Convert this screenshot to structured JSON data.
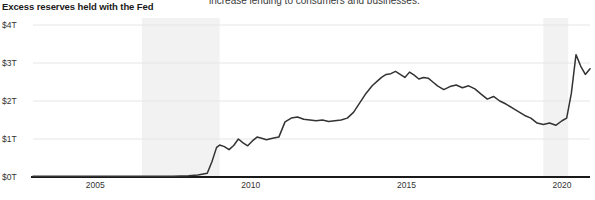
{
  "chart_data": {
    "type": "line",
    "title": "Excess reserves held with the Fed",
    "xlabel": "",
    "ylabel": "",
    "ylim": [
      0,
      4
    ],
    "xlim": [
      2003.0,
      2020.9
    ],
    "y_unit": "trillions of USD",
    "grid": true,
    "legend": "none",
    "y_ticks": [
      0,
      1,
      2,
      3,
      4
    ],
    "y_tick_labels": [
      "$0T",
      "$1T",
      "$2T",
      "$3T",
      "$4T"
    ],
    "x_ticks": [
      2005,
      2010,
      2015,
      2020
    ],
    "x_tick_labels": [
      "2005",
      "2010",
      "2015",
      "2020"
    ],
    "line_color": "#333333",
    "grid_color": "#e6e6e6",
    "axis_color": "#1a1a1a",
    "shaded_regions": [
      {
        "label": "recession",
        "x0": 2006.5,
        "x1": 2009.0,
        "color": "#f2f2f2"
      },
      {
        "label": "recession",
        "x0": 2019.4,
        "x1": 2020.2,
        "color": "#f2f2f2"
      }
    ],
    "series": [
      {
        "name": "Excess reserves held with the Fed",
        "x": [
          2003.0,
          2003.5,
          2004.0,
          2004.5,
          2005.0,
          2005.5,
          2006.0,
          2006.5,
          2007.0,
          2007.5,
          2008.0,
          2008.3,
          2008.6,
          2008.75,
          2008.9,
          2009.0,
          2009.15,
          2009.3,
          2009.45,
          2009.6,
          2009.75,
          2009.9,
          2010.05,
          2010.2,
          2010.35,
          2010.5,
          2010.7,
          2010.9,
          2011.1,
          2011.3,
          2011.5,
          2011.7,
          2011.9,
          2012.1,
          2012.3,
          2012.5,
          2012.7,
          2012.9,
          2013.1,
          2013.3,
          2013.5,
          2013.7,
          2013.9,
          2014.1,
          2014.2,
          2014.35,
          2014.5,
          2014.65,
          2014.8,
          2014.95,
          2015.1,
          2015.25,
          2015.4,
          2015.55,
          2015.7,
          2015.85,
          2016.0,
          2016.2,
          2016.4,
          2016.6,
          2016.8,
          2017.0,
          2017.2,
          2017.4,
          2017.6,
          2017.8,
          2018.0,
          2018.2,
          2018.4,
          2018.6,
          2018.8,
          2019.0,
          2019.2,
          2019.4,
          2019.6,
          2019.8,
          2020.0,
          2020.15,
          2020.3,
          2020.45,
          2020.6,
          2020.75,
          2020.9
        ],
        "y": [
          0.02,
          0.02,
          0.02,
          0.02,
          0.02,
          0.02,
          0.02,
          0.02,
          0.02,
          0.02,
          0.03,
          0.05,
          0.1,
          0.4,
          0.78,
          0.84,
          0.8,
          0.72,
          0.83,
          1.0,
          0.9,
          0.82,
          0.95,
          1.05,
          1.02,
          0.98,
          1.02,
          1.05,
          1.45,
          1.55,
          1.58,
          1.52,
          1.5,
          1.48,
          1.5,
          1.46,
          1.48,
          1.5,
          1.55,
          1.7,
          1.95,
          2.2,
          2.4,
          2.55,
          2.62,
          2.7,
          2.72,
          2.78,
          2.7,
          2.62,
          2.76,
          2.68,
          2.58,
          2.62,
          2.6,
          2.5,
          2.4,
          2.3,
          2.38,
          2.42,
          2.35,
          2.4,
          2.32,
          2.18,
          2.05,
          2.12,
          2.0,
          1.92,
          1.82,
          1.72,
          1.62,
          1.55,
          1.42,
          1.38,
          1.42,
          1.36,
          1.48,
          1.55,
          2.2,
          3.22,
          2.92,
          2.7,
          2.85
        ]
      }
    ]
  },
  "annotations": {
    "body_text_fragment": "increase lending to consumers and businesses.",
    "source_note": ""
  }
}
